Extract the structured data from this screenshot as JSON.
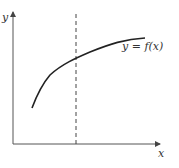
{
  "diagram": {
    "axes": {
      "x_label": "x",
      "y_label": "y"
    },
    "curve": {
      "label": "y = f(x)",
      "color": "#222222"
    },
    "dashed_line": {
      "color": "#444444"
    },
    "axis_color": "#555555"
  }
}
